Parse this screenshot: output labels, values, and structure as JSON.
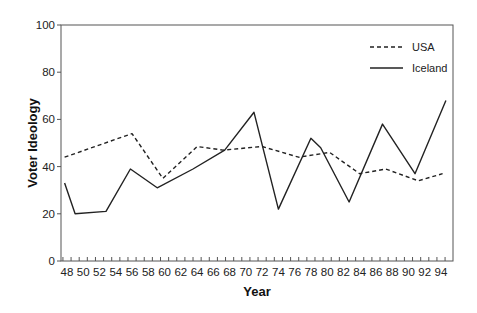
{
  "chart_data": {
    "type": "line",
    "title": "",
    "xlabel": "Year",
    "ylabel": "Voter Ideology",
    "ylim": [
      0,
      100
    ],
    "yticks": [
      0,
      20,
      40,
      60,
      80,
      100
    ],
    "xticks": [
      "48",
      "50",
      "52",
      "54",
      "56",
      "58",
      "60",
      "62",
      "64",
      "66",
      "68",
      "70",
      "72",
      "74",
      "76",
      "78",
      "80",
      "82",
      "84",
      "86",
      "88",
      "90",
      "92",
      "94"
    ],
    "grid": false,
    "legend_position": "upper right",
    "series": [
      {
        "name": "USA",
        "style": "dashed",
        "x": [
          47.7,
          56,
          59.8,
          64,
          67.2,
          72,
          76.5,
          80.3,
          84,
          87.2,
          91.2,
          94.2
        ],
        "y": [
          44,
          54,
          35,
          48.5,
          47,
          48.5,
          44,
          46,
          37,
          39,
          34,
          37
        ]
      },
      {
        "name": "Iceland",
        "style": "solid",
        "x": [
          47.7,
          49,
          52.8,
          55.8,
          59.1,
          63.5,
          67.4,
          71,
          74,
          78,
          79.2,
          82.7,
          86.8,
          90.8,
          94.6
        ],
        "y": [
          33,
          20,
          21,
          39,
          31,
          39,
          47,
          63,
          22,
          52,
          48,
          25,
          58,
          37,
          68
        ]
      }
    ]
  }
}
